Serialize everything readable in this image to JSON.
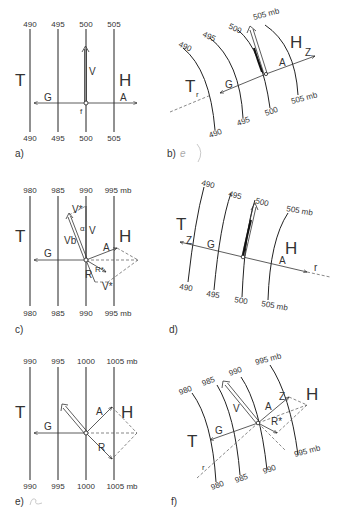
{
  "figure": {
    "panels": [
      {
        "id": "a",
        "label": "a)",
        "isobars_top": [
          "490",
          "495",
          "500",
          "505"
        ],
        "isobars_bottom": [
          "490",
          "495",
          "500",
          "505"
        ],
        "low": "T",
        "high": "H",
        "vectors": {
          "v": "V",
          "g": "G",
          "a": "A",
          "f": "f"
        }
      },
      {
        "id": "b",
        "label": "b)",
        "annotation": "e",
        "isobars_top": [
          "490",
          "495",
          "500",
          "505 mb"
        ],
        "isobars_bottom": [
          "490",
          "495",
          "500",
          "505 mb"
        ],
        "low": "T",
        "high": "H",
        "vectors": {
          "g": "G",
          "a": "A",
          "z": "Z",
          "r": "r"
        }
      },
      {
        "id": "c",
        "label": "c)",
        "isobars_top": [
          "980",
          "985",
          "990",
          "995 mb"
        ],
        "isobars_bottom": [
          "980",
          "985",
          "990",
          "995 mb"
        ],
        "low": "T",
        "high": "H",
        "vectors": {
          "v_star_top": "V*",
          "alpha": "α",
          "v": "V",
          "vb": "Vb",
          "g": "G",
          "a": "A",
          "r_star": "R*",
          "r": "R",
          "v_star_bottom": "V*"
        }
      },
      {
        "id": "d",
        "label": "d)",
        "isobars_top": [
          "490",
          "495",
          "500",
          "505 mb"
        ],
        "isobars_bottom": [
          "490",
          "495",
          "500",
          "505 mb"
        ],
        "low": "T",
        "high": "H",
        "vectors": {
          "z": "Z",
          "g": "G",
          "a": "A",
          "r": "r"
        }
      },
      {
        "id": "e",
        "label": "e)",
        "isobars_top": [
          "990",
          "995",
          "1000",
          "1005 mb"
        ],
        "isobars_bottom": [
          "990",
          "995",
          "1000",
          "1005 mb"
        ],
        "low": "T",
        "high": "H",
        "vectors": {
          "g": "G",
          "a": "A",
          "r": "R"
        }
      },
      {
        "id": "f",
        "label": "f)",
        "isobars_top": [
          "980",
          "985",
          "990",
          "995 mb"
        ],
        "isobars_bottom": [
          "980",
          "985",
          "990",
          "995 mb"
        ],
        "low": "T",
        "high": "H",
        "vectors": {
          "v": "V",
          "g": "G",
          "a": "A",
          "z": "Z",
          "r_star": "R*",
          "r": "r"
        }
      }
    ]
  }
}
